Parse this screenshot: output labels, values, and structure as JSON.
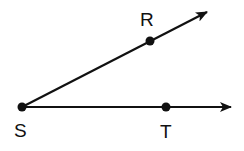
{
  "diagram": {
    "type": "angle",
    "vertex": {
      "name": "S",
      "x": 22,
      "y": 107,
      "label_x": 14,
      "label_y": 137
    },
    "rays": [
      {
        "name": "ray-SR",
        "from": "S",
        "through": "R",
        "end_x": 207,
        "end_y": 12
      },
      {
        "name": "ray-ST",
        "from": "S",
        "through": "T",
        "end_x": 231,
        "end_y": 107
      }
    ],
    "points": [
      {
        "name": "R",
        "x": 150,
        "y": 41,
        "label_x": 140,
        "label_y": 26
      },
      {
        "name": "T",
        "x": 166,
        "y": 107,
        "label_x": 160,
        "label_y": 138
      }
    ],
    "colors": {
      "stroke": "#111111",
      "background": "#ffffff"
    }
  }
}
